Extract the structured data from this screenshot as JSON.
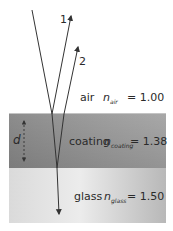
{
  "diagram": {
    "type": "thin-film anti-reflection coating ray diagram",
    "layers": [
      {
        "name": "air",
        "label": "air",
        "n_symbol": "n",
        "n_subscript": "air",
        "value": "= 1.00",
        "color_top": "#ffffff",
        "color_bottom": "#ffffff"
      },
      {
        "name": "coating",
        "label": "coating",
        "n_symbol": "n",
        "n_subscript": "coating",
        "value": "= 1.38",
        "color_left": "#8f8f8f",
        "color_right": "#a6a6a6"
      },
      {
        "name": "glass",
        "label": "glass",
        "n_symbol": "n",
        "n_subscript": "glass",
        "value": "= 1.50",
        "color_left": "#dedede",
        "color_right": "#b9b9b9"
      }
    ],
    "rays": [
      {
        "id": "incident",
        "label": ""
      },
      {
        "id": "reflected-1",
        "label": "1"
      },
      {
        "id": "reflected-2",
        "label": "2"
      }
    ],
    "thickness": {
      "label": "d"
    },
    "line_color": "#333333"
  }
}
